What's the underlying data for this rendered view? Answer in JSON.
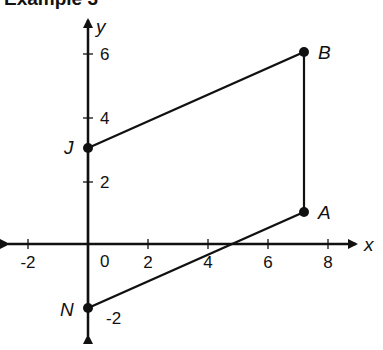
{
  "title": "Example 3",
  "axes": {
    "x_label": "x",
    "y_label": "y",
    "x_ticks": [
      {
        "value": -2,
        "label": "-2"
      },
      {
        "value": 2,
        "label": "2"
      },
      {
        "value": 4,
        "label": "4"
      },
      {
        "value": 6,
        "label": "6"
      },
      {
        "value": 8,
        "label": "8"
      }
    ],
    "y_ticks": [
      {
        "value": 2,
        "label": "2"
      },
      {
        "value": 4,
        "label": "4"
      },
      {
        "value": 6,
        "label": "6"
      },
      {
        "value": -2,
        "label": "-2"
      }
    ],
    "origin_label": "0",
    "x_range": [
      -2.8,
      9
    ],
    "y_range": [
      -3.2,
      7
    ]
  },
  "points": [
    {
      "name": "J",
      "x": 0,
      "y": 3
    },
    {
      "name": "B",
      "x": 7.2,
      "y": 6
    },
    {
      "name": "A",
      "x": 7.2,
      "y": 1
    },
    {
      "name": "N",
      "x": 0,
      "y": -2
    }
  ],
  "polygon": [
    "J",
    "B",
    "A",
    "N"
  ],
  "colors": {
    "stroke": "#111111",
    "background": "#ffffff"
  }
}
